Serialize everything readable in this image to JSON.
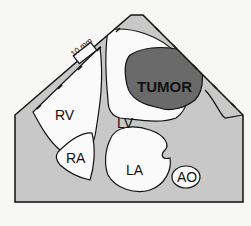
{
  "diagram": {
    "type": "echocardiographic cross-section schematic",
    "scale_bar": {
      "label": "10 mm"
    },
    "labels": {
      "tumor": "TUMOR",
      "rv": "RV",
      "lv": "LV",
      "ra": "RA",
      "la": "LA",
      "ao": "AO"
    },
    "colors": {
      "background": "#f7f7f5",
      "tissue": "#c8c8c8",
      "tumor": "#6a6a6a",
      "chamber": "#fafafa",
      "outline": "#111111"
    }
  }
}
